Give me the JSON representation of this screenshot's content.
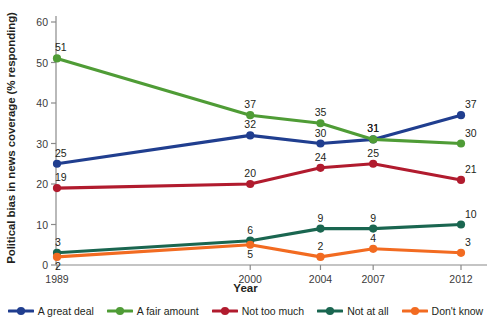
{
  "chart_data": {
    "type": "line",
    "title": "",
    "xlabel": "Year",
    "ylabel": "Political bias in news coverage (% responding)",
    "categories": [
      "1989",
      "2000",
      "2004",
      "2007",
      "2012"
    ],
    "x": [
      1989,
      2000,
      2004,
      2007,
      2012
    ],
    "xlim": [
      1989,
      2012
    ],
    "ylim": [
      0,
      60
    ],
    "yticks": [
      0,
      10,
      20,
      30,
      40,
      50,
      60
    ],
    "xticks": [
      "1989",
      "2000",
      "2004",
      "2007",
      "2012"
    ],
    "grid": false,
    "legend_position": "bottom",
    "data_labels": true,
    "series": [
      {
        "name": "A great deal",
        "color": "#203e8f",
        "values": [
          25,
          32,
          30,
          31,
          37
        ],
        "label_pos": [
          "above",
          "above",
          "above",
          "above",
          "above"
        ]
      },
      {
        "name": "A fair amount",
        "color": "#4f9c36",
        "values": [
          51,
          37,
          35,
          31,
          30
        ],
        "label_pos": [
          "above",
          "above",
          "above",
          "above",
          "above"
        ]
      },
      {
        "name": "Not too much",
        "color": "#b11b2e",
        "values": [
          19,
          20,
          24,
          25,
          21
        ],
        "label_pos": [
          "above",
          "above",
          "above",
          "above",
          "above"
        ]
      },
      {
        "name": "Not at all",
        "color": "#1a6650",
        "values": [
          3,
          6,
          9,
          9,
          10
        ],
        "label_pos": [
          "above",
          "above",
          "above",
          "above",
          "above"
        ]
      },
      {
        "name": "Don't know",
        "color": "#f26b21",
        "values": [
          2,
          5,
          2,
          4,
          3
        ],
        "label_pos": [
          "below",
          "below",
          "above",
          "above",
          "above"
        ]
      }
    ]
  },
  "axis": {
    "y_title": "Political bias in news coverage (% responding)",
    "x_title": "Year",
    "y_ticks": [
      "0",
      "10",
      "20",
      "30",
      "40",
      "50",
      "60"
    ],
    "x_ticks": [
      "1989",
      "2000",
      "2004",
      "2007",
      "2012"
    ]
  },
  "legend": {
    "items": [
      {
        "label": "A great deal",
        "color": "#203e8f"
      },
      {
        "label": "A fair amount",
        "color": "#4f9c36"
      },
      {
        "label": "Not too much",
        "color": "#b11b2e"
      },
      {
        "label": "Not at all",
        "color": "#1a6650"
      },
      {
        "label": "Don't know",
        "color": "#f26b21"
      }
    ]
  }
}
